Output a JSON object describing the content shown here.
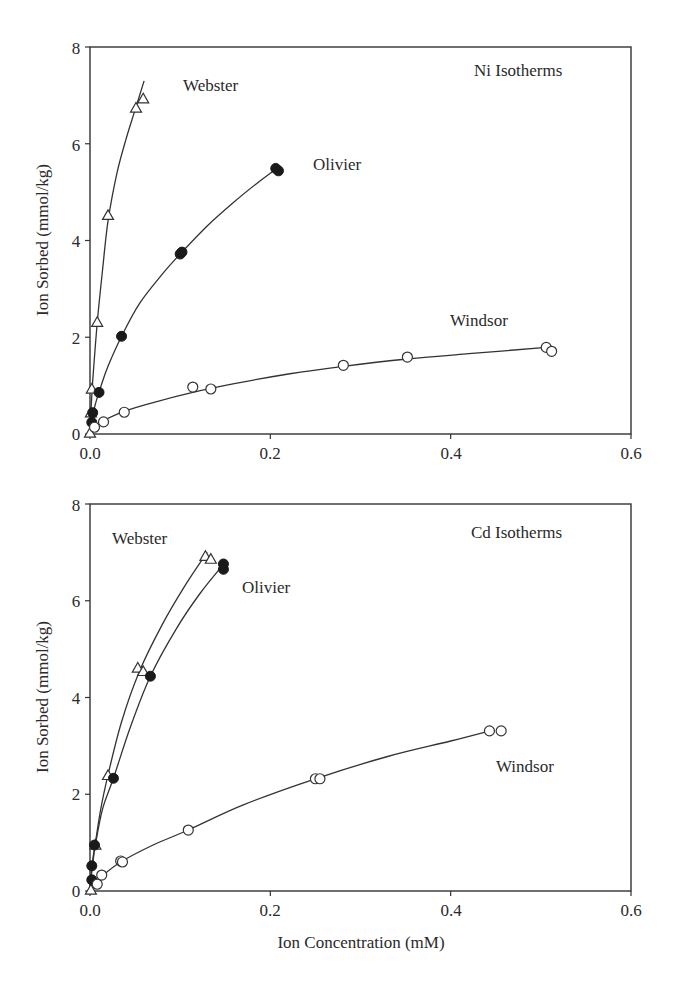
{
  "figure": {
    "x_axis_title": "Ion Concentration (mM)",
    "y_axis_title": "Ion Sorbed (mmol/kg)"
  },
  "chart_data": [
    {
      "type": "scatter",
      "title": "Ni Isotherms",
      "xlabel": "",
      "ylabel": "Ion Sorbed (mmol/kg)",
      "xlim": [
        0,
        0.6
      ],
      "ylim": [
        0,
        8
      ],
      "xticks": [
        "0.0",
        "0.2",
        "0.4",
        "0.6"
      ],
      "yticks": [
        "0",
        "2",
        "4",
        "6",
        "8"
      ],
      "grid": false,
      "legend": "inline labels",
      "series": [
        {
          "name": "Webster",
          "marker": "open-triangle",
          "points": [
            [
              0.0,
              0.02
            ],
            [
              0.001,
              0.44
            ],
            [
              0.002,
              0.93
            ],
            [
              0.008,
              2.31
            ],
            [
              0.02,
              4.52
            ],
            [
              0.051,
              6.74
            ],
            [
              0.059,
              6.93
            ]
          ],
          "fit_curve": [
            [
              0.0,
              0.0
            ],
            [
              0.001,
              0.45
            ],
            [
              0.003,
              1.1
            ],
            [
              0.008,
              2.3
            ],
            [
              0.014,
              3.4
            ],
            [
              0.02,
              4.4
            ],
            [
              0.03,
              5.4
            ],
            [
              0.04,
              6.1
            ],
            [
              0.05,
              6.7
            ],
            [
              0.06,
              7.3
            ]
          ]
        },
        {
          "name": "Olivier",
          "marker": "filled-circle",
          "points": [
            [
              0.002,
              0.24
            ],
            [
              0.003,
              0.44
            ],
            [
              0.01,
              0.86
            ],
            [
              0.035,
              2.02
            ],
            [
              0.1,
              3.72
            ],
            [
              0.102,
              3.76
            ],
            [
              0.206,
              5.49
            ],
            [
              0.209,
              5.44
            ]
          ],
          "fit_curve": [
            [
              0.0,
              0.0
            ],
            [
              0.002,
              0.3
            ],
            [
              0.006,
              0.62
            ],
            [
              0.012,
              0.98
            ],
            [
              0.02,
              1.4
            ],
            [
              0.035,
              2.02
            ],
            [
              0.055,
              2.7
            ],
            [
              0.08,
              3.3
            ],
            [
              0.1,
              3.72
            ],
            [
              0.13,
              4.3
            ],
            [
              0.16,
              4.8
            ],
            [
              0.185,
              5.18
            ],
            [
              0.208,
              5.5
            ]
          ]
        },
        {
          "name": "Windsor",
          "marker": "open-circle",
          "points": [
            [
              0.005,
              0.14
            ],
            [
              0.015,
              0.25
            ],
            [
              0.038,
              0.45
            ],
            [
              0.114,
              0.97
            ],
            [
              0.134,
              0.93
            ],
            [
              0.281,
              1.42
            ],
            [
              0.352,
              1.59
            ],
            [
              0.506,
              1.79
            ],
            [
              0.512,
              1.71
            ]
          ],
          "fit_curve": [
            [
              0.0,
              0.05
            ],
            [
              0.005,
              0.16
            ],
            [
              0.015,
              0.28
            ],
            [
              0.038,
              0.47
            ],
            [
              0.07,
              0.65
            ],
            [
              0.114,
              0.86
            ],
            [
              0.16,
              1.04
            ],
            [
              0.22,
              1.24
            ],
            [
              0.281,
              1.4
            ],
            [
              0.352,
              1.55
            ],
            [
              0.42,
              1.66
            ],
            [
              0.506,
              1.79
            ]
          ]
        }
      ],
      "labels": {
        "webster": "Webster",
        "olivier": "Olivier",
        "windsor": "Windsor"
      }
    },
    {
      "type": "scatter",
      "title": "Cd Isotherms",
      "xlabel": "Ion Concentration (mM)",
      "ylabel": "Ion Sorbed (mmol/kg)",
      "xlim": [
        0,
        0.6
      ],
      "ylim": [
        0,
        8
      ],
      "xticks": [
        "0.0",
        "0.2",
        "0.4",
        "0.6"
      ],
      "yticks": [
        "0",
        "2",
        "4",
        "6",
        "8"
      ],
      "grid": false,
      "legend": "inline labels",
      "series": [
        {
          "name": "Webster",
          "marker": "open-triangle",
          "points": [
            [
              0.001,
              0.02
            ],
            [
              0.006,
              0.95
            ],
            [
              0.02,
              2.39
            ],
            [
              0.053,
              4.61
            ],
            [
              0.059,
              4.54
            ],
            [
              0.128,
              6.92
            ],
            [
              0.134,
              6.86
            ]
          ],
          "fit_curve": [
            [
              0.0,
              0.0
            ],
            [
              0.002,
              0.5
            ],
            [
              0.006,
              1.0
            ],
            [
              0.012,
              1.7
            ],
            [
              0.02,
              2.4
            ],
            [
              0.035,
              3.5
            ],
            [
              0.055,
              4.55
            ],
            [
              0.08,
              5.5
            ],
            [
              0.105,
              6.3
            ],
            [
              0.13,
              7.0
            ]
          ]
        },
        {
          "name": "Olivier",
          "marker": "filled-circle",
          "points": [
            [
              0.002,
              0.23
            ],
            [
              0.002,
              0.52
            ],
            [
              0.005,
              0.95
            ],
            [
              0.026,
              2.33
            ],
            [
              0.067,
              4.44
            ],
            [
              0.148,
              6.76
            ],
            [
              0.148,
              6.65
            ]
          ],
          "fit_curve": [
            [
              0.0,
              0.0
            ],
            [
              0.002,
              0.4
            ],
            [
              0.006,
              0.95
            ],
            [
              0.014,
              1.7
            ],
            [
              0.026,
              2.33
            ],
            [
              0.045,
              3.4
            ],
            [
              0.067,
              4.44
            ],
            [
              0.095,
              5.4
            ],
            [
              0.122,
              6.15
            ],
            [
              0.148,
              6.75
            ]
          ]
        },
        {
          "name": "Windsor",
          "marker": "open-circle",
          "points": [
            [
              0.008,
              0.14
            ],
            [
              0.013,
              0.33
            ],
            [
              0.034,
              0.62
            ],
            [
              0.036,
              0.6
            ],
            [
              0.109,
              1.26
            ],
            [
              0.25,
              2.32
            ],
            [
              0.255,
              2.32
            ],
            [
              0.443,
              3.31
            ],
            [
              0.456,
              3.31
            ]
          ],
          "fit_curve": [
            [
              0.0,
              0.02
            ],
            [
              0.008,
              0.18
            ],
            [
              0.013,
              0.3
            ],
            [
              0.034,
              0.6
            ],
            [
              0.07,
              0.95
            ],
            [
              0.109,
              1.26
            ],
            [
              0.17,
              1.78
            ],
            [
              0.25,
              2.32
            ],
            [
              0.33,
              2.78
            ],
            [
              0.4,
              3.1
            ],
            [
              0.443,
              3.31
            ]
          ]
        }
      ],
      "labels": {
        "webster": "Webster",
        "olivier": "Olivier",
        "windsor": "Windsor"
      }
    }
  ]
}
